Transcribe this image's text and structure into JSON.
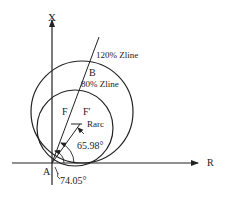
{
  "diagram": {
    "type": "mho-relay-characteristic",
    "axes": {
      "vertical_label": "X",
      "horizontal_label": "R",
      "origin_label": "A"
    },
    "circles": [
      {
        "name": "outer",
        "label": "120% Zline"
      },
      {
        "name": "inner",
        "label": "80% Zline"
      }
    ],
    "points": {
      "B": "B",
      "F": "F",
      "F_prime": "F'"
    },
    "annotations": {
      "rarc": "Rarc",
      "angle_small": "65.98°",
      "angle_large": "74.05°"
    },
    "colors": {
      "line": "#222222",
      "background": "#ffffff"
    }
  }
}
